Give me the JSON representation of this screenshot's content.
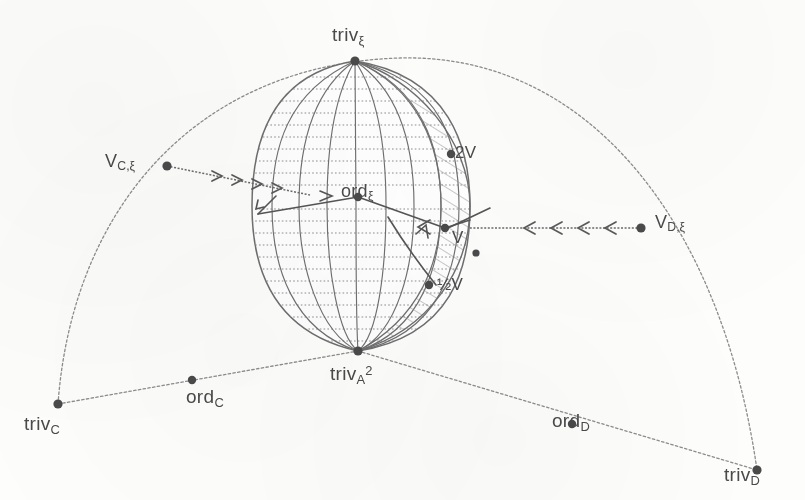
{
  "figure": {
    "colors": {
      "ink": "#555555",
      "ink_light": "#8a8a8a",
      "hatch": "#9a9a9a",
      "background": "#fdfdfc"
    }
  },
  "labels": {
    "top_vertex": {
      "base": "triv",
      "sub": "ξ"
    },
    "left_vertex": {
      "base": "V",
      "sub": "C,ξ"
    },
    "right_vertex": {
      "base": "V",
      "sub": "D,ξ"
    },
    "center": {
      "base": "ord",
      "sub": "ξ"
    },
    "bottom_vertex": {
      "base": "triv",
      "sub": "A",
      "sup": "2"
    },
    "bottom_left_vertex": {
      "base": "triv",
      "sub": "C"
    },
    "bottom_right_vertex": {
      "base": "triv",
      "sub": "D"
    },
    "left_mid": {
      "base": "ord",
      "sub": "C"
    },
    "right_mid": {
      "base": "ord",
      "sub": "D"
    },
    "lune_upper": {
      "base": "2V"
    },
    "lune_middle": {
      "base": "V"
    },
    "lune_lower": {
      "base": "½V"
    }
  },
  "points": {
    "top_vertex": {
      "x": 355,
      "y": 61
    },
    "bottom_vertex": {
      "x": 358,
      "y": 351
    },
    "center": {
      "x": 358,
      "y": 197
    },
    "left_vertex": {
      "x": 167,
      "y": 166
    },
    "right_vertex": {
      "x": 641,
      "y": 228
    },
    "bottom_left_vertex": {
      "x": 58,
      "y": 404
    },
    "bottom_right_vertex": {
      "x": 757,
      "y": 470
    },
    "left_mid": {
      "x": 192,
      "y": 380
    },
    "right_mid": {
      "x": 572,
      "y": 424
    },
    "lune_upper": {
      "x": 451,
      "y": 154
    },
    "lune_middle": {
      "x": 448,
      "y": 226
    },
    "lune_lower": {
      "x": 436,
      "y": 285
    }
  },
  "arrows": {
    "left_chain_count": 4,
    "right_chain_count": 4,
    "left_direction": "right",
    "right_direction": "left"
  }
}
